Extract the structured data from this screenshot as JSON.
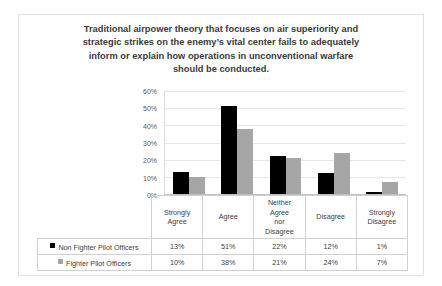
{
  "chart_data": {
    "type": "bar",
    "title_lines": [
      "Traditional airpower theory that focuses on air superiority and",
      "strategic strikes on the enemy’s vital center fails to adequately",
      "inform or explain how operations in unconventional warfare",
      "should be conducted."
    ],
    "xlabel": "",
    "ylabel": "",
    "ylim": [
      0,
      60
    ],
    "ytick_labels": [
      "0%",
      "10%",
      "20%",
      "30%",
      "40%",
      "50%",
      "60%"
    ],
    "ytick_values": [
      0,
      10,
      20,
      30,
      40,
      50,
      60
    ],
    "grid": true,
    "legend_position": "bottom-table",
    "categories": [
      "Strongly Agree",
      "Agree",
      "Neither Agree nor Disagree",
      "Disagree",
      "Strongly Disagree"
    ],
    "category_lines": [
      [
        "Strongly",
        "Agree"
      ],
      [
        "Agree"
      ],
      [
        "Neither",
        "Agree",
        "nor",
        "Disagree"
      ],
      [
        "Disagree"
      ],
      [
        "Strongly",
        "Disagree"
      ]
    ],
    "series": [
      {
        "name": "Non Fighter Pilot Officers",
        "color": "#000000",
        "values": [
          13,
          51,
          22,
          12,
          1
        ],
        "labels": [
          "13%",
          "51%",
          "22%",
          "12%",
          "1%"
        ]
      },
      {
        "name": "Fighter Pilot Officers",
        "color": "#a6a6a6",
        "values": [
          10,
          38,
          21,
          24,
          7
        ],
        "labels": [
          "10%",
          "38%",
          "21%",
          "24%",
          "7%"
        ]
      }
    ]
  }
}
